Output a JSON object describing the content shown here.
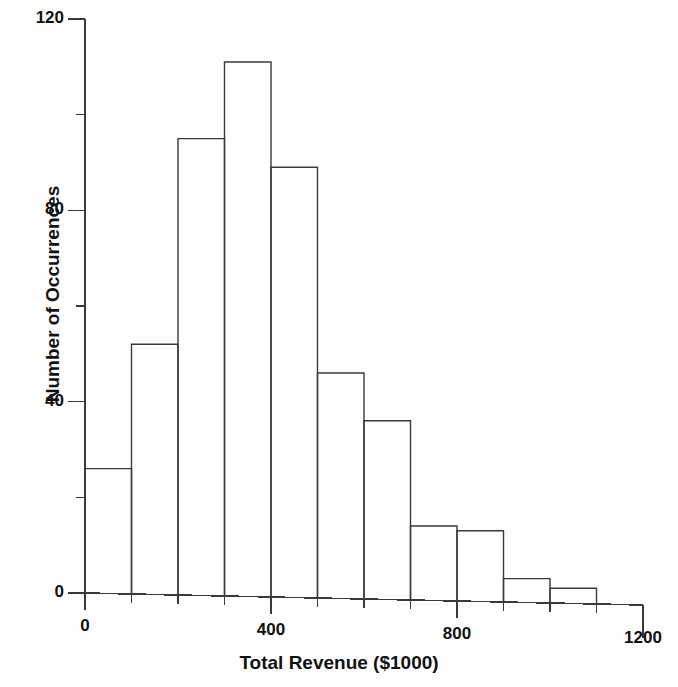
{
  "chart_data": {
    "type": "bar",
    "title": "",
    "subtitle": "",
    "xlabel": "Total Revenue ($1000)",
    "ylabel": "Number of Occurrences",
    "categories": [
      "0-100",
      "100-200",
      "200-300",
      "300-400",
      "400-500",
      "500-600",
      "600-700",
      "700-800",
      "800-900",
      "900-1000",
      "1000-1100"
    ],
    "bin_edges": [
      0,
      100,
      200,
      300,
      400,
      500,
      600,
      700,
      800,
      900,
      1000,
      1100
    ],
    "bin_width": 100,
    "values": [
      26,
      52,
      95,
      111,
      89,
      46,
      36,
      14,
      13,
      3,
      1
    ],
    "xlim": [
      0,
      1200
    ],
    "ylim": [
      0,
      120
    ],
    "x_major_ticks": [
      0,
      400,
      800,
      1200
    ],
    "x_major_tick_labels": [
      "0",
      "400",
      "800",
      "1200"
    ],
    "x_minor_ticks": [
      100,
      200,
      300,
      500,
      600,
      700,
      900,
      1000,
      1100
    ],
    "y_major_ticks": [
      0,
      40,
      80,
      120
    ],
    "y_major_tick_labels": [
      "0",
      "40",
      "80",
      "120"
    ],
    "y_minor_ticks": [
      20,
      60,
      100
    ],
    "grid": false,
    "legend": false,
    "legend_position": "none",
    "bar_fill_color": "#ffffff",
    "bar_edge_color": "#3a3a3a",
    "axis_color": "#3a3a3a",
    "background_color": "#ffffff"
  },
  "axes": {
    "x_title": "Total Revenue ($1000)",
    "y_title": "Number of Occurrences"
  }
}
